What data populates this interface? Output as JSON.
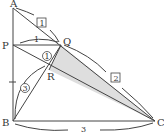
{
  "diagram": {
    "points": {
      "A": "A",
      "P": "P",
      "Q": "Q",
      "R": "R",
      "B": "B",
      "C": "C"
    },
    "labels": {
      "pq_length": "1",
      "bc_length": "3",
      "box1": "1",
      "box2": "2",
      "circle1": "1",
      "circle3": "3"
    },
    "colors": {
      "line": "#444444",
      "shade": "#dedede"
    }
  }
}
